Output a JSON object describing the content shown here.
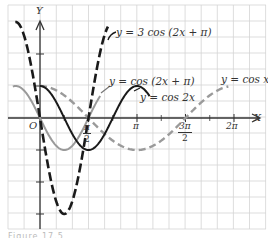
{
  "figure": {
    "axis_labels": {
      "x": "X",
      "y": "Y",
      "origin": "O"
    },
    "tick_labels": {
      "pi_over_2": {
        "num": "π",
        "den": "2"
      },
      "pi": "π",
      "three_pi_over_2": {
        "num": "3π",
        "den": "2"
      },
      "two_pi": "2π"
    },
    "curve_labels": {
      "amp3": "y = 3 cos (2x + π)",
      "shifted": "y = cos (2x + π)",
      "cos2x": "y = cos 2x",
      "cosx": "y = cos x"
    },
    "caption": "Figure 17.5"
  },
  "chart_data": {
    "type": "line",
    "title": "",
    "xlabel": "X",
    "ylabel": "Y",
    "x_ticks": [
      "π/2",
      "π",
      "3π/2",
      "2π"
    ],
    "y_tick_values": [
      -3,
      -2,
      -1,
      1,
      2
    ],
    "grid": true,
    "xlim": [
      -1.04,
      7.3
    ],
    "ylim": [
      -3.5,
      3.5
    ],
    "series": [
      {
        "name": "y = cos x",
        "style": "dashed",
        "color": "#9a9a9a",
        "width": 2.4,
        "expr": "cos(x)",
        "amp": 1,
        "freq": 1,
        "phase": 0,
        "fn": "cos",
        "x_range": [
          0,
          6.1
        ]
      },
      {
        "name": "y = cos 2x",
        "style": "solid",
        "color": "#1a1a1a",
        "width": 2.0,
        "expr": "cos(2x)",
        "amp": 1,
        "freq": 2,
        "phase": 0,
        "fn": "cos",
        "x_range": [
          0,
          3.55
        ]
      },
      {
        "name": "y = cos (2x + π)",
        "style": "solid",
        "color": "#9a9a9a",
        "width": 2.0,
        "expr": "-sin(2x)",
        "amp": -1,
        "freq": 2,
        "phase": 0,
        "fn": "sin",
        "x_range": [
          -0.88,
          1.95
        ]
      },
      {
        "name": "y = 3 cos (2x + π)",
        "style": "dashed-heavy",
        "color": "#1a1a1a",
        "width": 2.6,
        "expr": "-3 sin(2x)",
        "amp": -3,
        "freq": 2,
        "phase": 0,
        "fn": "sin",
        "x_range": [
          -0.8,
          2.2
        ]
      }
    ]
  }
}
